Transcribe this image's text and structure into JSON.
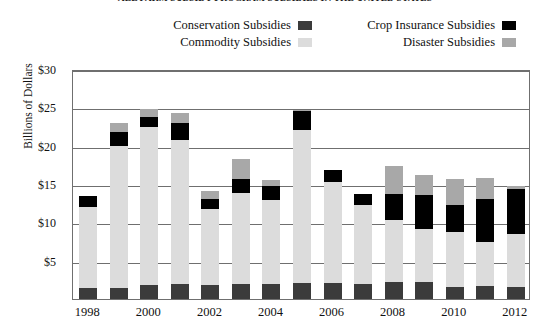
{
  "chart_data": {
    "type": "bar",
    "subtype": "stacked-bar",
    "title": "ALL FARM SUBSIDY PROGRAM SUBSIDIES IN THE UNITED STATES",
    "xlabel": "",
    "ylabel": "Billions of Dollars",
    "ylim": [
      0,
      30
    ],
    "ytick_values": [
      5,
      10,
      15,
      20,
      25,
      30
    ],
    "ytick_labels": [
      "$5",
      "$10",
      "$15",
      "$20",
      "$25",
      "$30"
    ],
    "grid": true,
    "legend_position": "top",
    "categories": [
      1998,
      1999,
      2000,
      2001,
      2002,
      2003,
      2004,
      2005,
      2006,
      2007,
      2008,
      2009,
      2010,
      2011,
      2012
    ],
    "xtick_labels": [
      "1998",
      "2000",
      "2002",
      "2004",
      "2006",
      "2008",
      "2010",
      "2012"
    ],
    "xtick_categories": [
      1998,
      2000,
      2002,
      2004,
      2006,
      2008,
      2010,
      2012
    ],
    "stack_order": [
      "conservation",
      "commodity",
      "crop_insurance",
      "disaster"
    ],
    "series": [
      {
        "name": "Conservation Subsidies",
        "key": "conservation",
        "color": "#3b3b3b",
        "values": [
          1.5,
          1.5,
          1.8,
          2.0,
          1.8,
          1.9,
          1.9,
          2.1,
          2.1,
          2.0,
          2.2,
          2.2,
          1.6,
          1.7,
          1.6
        ]
      },
      {
        "name": "Commodity Subsidies",
        "key": "commodity",
        "color": "#dcdcdc",
        "values": [
          10.5,
          18.5,
          20.6,
          18.7,
          9.9,
          11.9,
          11.0,
          19.9,
          13.2,
          10.3,
          8.1,
          6.9,
          7.1,
          5.8,
          6.9
        ]
      },
      {
        "name": "Crop Insurance Subsidies",
        "key": "crop_insurance",
        "color": "#000000",
        "values": [
          1.5,
          1.8,
          1.3,
          2.3,
          1.3,
          1.8,
          1.9,
          2.5,
          1.5,
          1.4,
          3.4,
          4.5,
          3.6,
          5.6,
          5.9
        ]
      },
      {
        "name": "Disaster Subsidies",
        "key": "disaster",
        "color": "#a8a8a8",
        "values": [
          0.0,
          1.2,
          1.1,
          1.2,
          1.1,
          2.6,
          0.7,
          0.2,
          0.0,
          0.0,
          3.7,
          2.6,
          3.4,
          2.7,
          0.3
        ]
      }
    ],
    "totals": [
      13.5,
      23.0,
      24.8,
      24.2,
      14.1,
      18.2,
      15.5,
      24.7,
      16.8,
      13.7,
      17.4,
      16.2,
      15.7,
      15.8,
      14.7
    ]
  },
  "legend": {
    "items": [
      {
        "label": "Conservation Subsidies",
        "swatch": "conservation-swatch"
      },
      {
        "label": "Crop Insurance Subsidies",
        "swatch": "crop-insurance-swatch"
      },
      {
        "label": "Commodity Subsidies",
        "swatch": "commodity-swatch"
      },
      {
        "label": "Disaster Subsidies",
        "swatch": "disaster-swatch"
      }
    ]
  }
}
